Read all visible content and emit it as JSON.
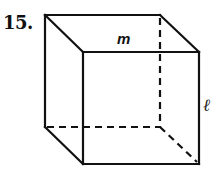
{
  "problem": {
    "number": "15."
  },
  "labels": {
    "top_edge": "m",
    "right_edge": "ℓ"
  },
  "figure": {
    "type": "cube",
    "vertices": {
      "back_top_left": [
        45,
        15
      ],
      "back_top_right": [
        160,
        15
      ],
      "back_bottom_left": [
        45,
        127
      ],
      "back_bottom_right": [
        160,
        127
      ],
      "front_top_left": [
        83,
        52
      ],
      "front_top_right": [
        199,
        52
      ],
      "front_bottom_left": [
        83,
        164
      ],
      "front_bottom_right": [
        199,
        164
      ]
    },
    "colors": {
      "stroke": "#111111",
      "background": "#ffffff"
    }
  }
}
